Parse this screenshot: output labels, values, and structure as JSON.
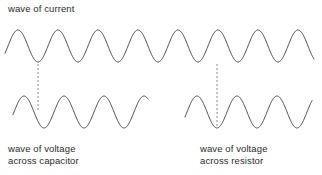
{
  "figure": {
    "title_text": "wave of current",
    "background_color": "#ffffff",
    "wave_stroke_color": "#4a4a4a",
    "guide_stroke_color": "#8c8c8c",
    "text_color": "#2b2b2b"
  },
  "labels": {
    "current": "wave of current",
    "capacitor_line1": "wave of voltage",
    "capacitor_line2": "across capacitor",
    "resistor_line1": "wave of voltage",
    "resistor_line2": "across resistor"
  },
  "chart_data": {
    "type": "line",
    "title": "wave of current",
    "xlabel": "",
    "ylabel": "",
    "grid": false,
    "legend_position": "none",
    "annotations": [
      "wave of current",
      "wave of voltage across capacitor",
      "wave of voltage across resistor"
    ],
    "series": [
      {
        "name": "wave of current",
        "waveform": "cosine",
        "x_start": 5,
        "x_end": 314,
        "period": 40,
        "amplitude": 16,
        "midline_y": 46,
        "peak_y": 30,
        "trough_y": 62,
        "phase_deg": 0,
        "peaks_x": [
          18,
          58,
          98,
          138,
          178,
          218,
          258,
          298
        ],
        "troughs_x": [
          38,
          78,
          118,
          158,
          198,
          238,
          278
        ]
      },
      {
        "name": "wave of voltage across capacitor",
        "waveform": "cosine",
        "x_start": 13,
        "x_end": 148,
        "period": 40,
        "amplitude": 16,
        "midline_y": 112,
        "peak_y": 96,
        "trough_y": 128,
        "phase_deg": -90,
        "peaks_x": [
          24,
          64,
          104
        ],
        "troughs_x": [
          44,
          84,
          124
        ],
        "phase_note": "voltage lags current by 90 degrees"
      },
      {
        "name": "wave of voltage across resistor",
        "waveform": "cosine",
        "x_start": 185,
        "x_end": 312,
        "period": 40,
        "amplitude": 16,
        "midline_y": 112,
        "peak_y": 96,
        "trough_y": 128,
        "phase_deg": 0,
        "peaks_x": [
          197,
          237,
          277
        ],
        "troughs_x": [
          217,
          257,
          297
        ],
        "phase_note": "voltage in phase with current"
      }
    ],
    "guides": [
      {
        "name": "capacitor-phase-guide",
        "x": 38,
        "y_top": 64,
        "y_bottom": 110
      },
      {
        "name": "resistor-phase-guide",
        "x": 217,
        "y_top": 64,
        "y_bottom": 127
      }
    ],
    "axis_ranges": {
      "xlim": [
        0,
        322
      ],
      "ylim": [
        175,
        0
      ]
    }
  }
}
